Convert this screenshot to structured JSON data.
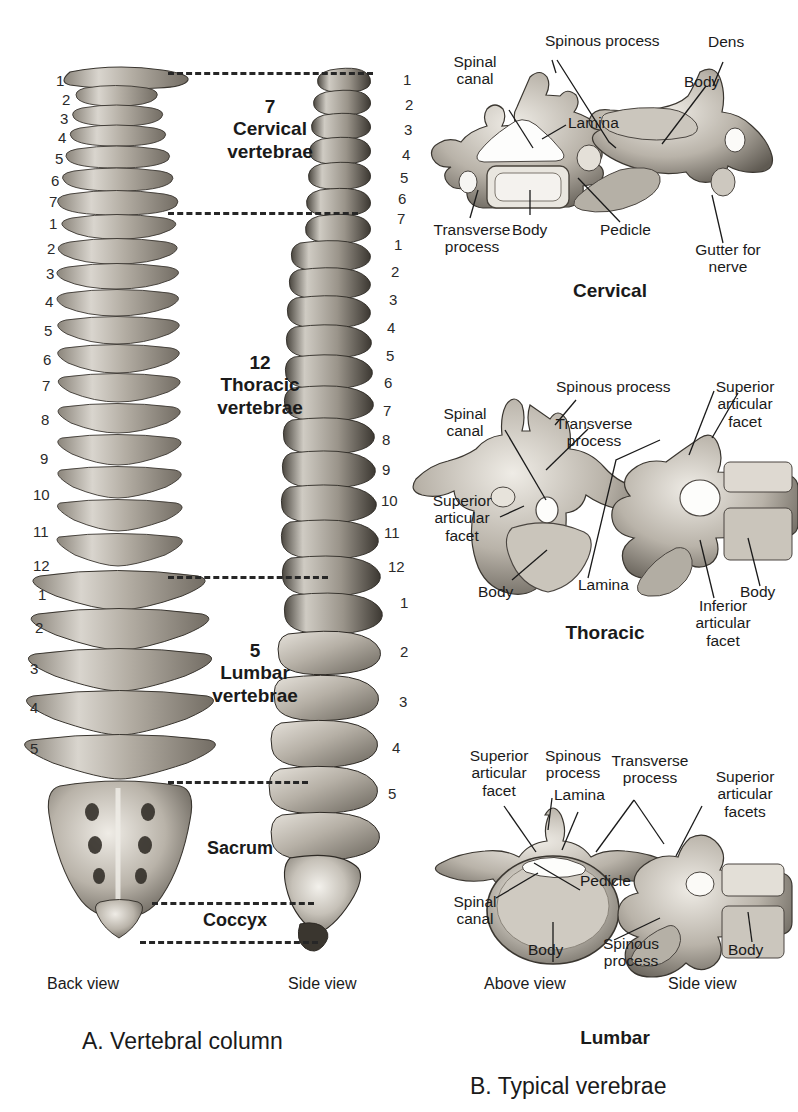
{
  "panelA": {
    "caption": "A. Vertebral column",
    "views": {
      "back": "Back view",
      "side": "Side view"
    },
    "regions": [
      {
        "count": "7",
        "name_line1": "Cervical",
        "name_line2": "vertebrae"
      },
      {
        "count": "12",
        "name_line1": "Thoracic",
        "name_line2": "vertebrae"
      },
      {
        "count": "5",
        "name_line1": "Lumbar",
        "name_line2": "vertebrae"
      }
    ],
    "sacrum_label": "Sacrum",
    "coccyx_label": "Coccyx",
    "back_numbers": {
      "cervical": [
        "1",
        "2",
        "3",
        "4",
        "5",
        "6",
        "7"
      ],
      "thoracic": [
        "1",
        "2",
        "3",
        "4",
        "5",
        "6",
        "7",
        "8",
        "9",
        "10",
        "11",
        "12"
      ],
      "lumbar": [
        "1",
        "2",
        "3",
        "4",
        "5"
      ]
    },
    "side_numbers": {
      "cervical": [
        "1",
        "2",
        "3",
        "4",
        "5",
        "6",
        "7"
      ],
      "thoracic": [
        "1",
        "2",
        "3",
        "4",
        "5",
        "6",
        "7",
        "8",
        "9",
        "10",
        "11",
        "12"
      ],
      "lumbar": [
        "1",
        "2",
        "3",
        "4",
        "5"
      ]
    }
  },
  "panelB": {
    "caption": "B. Typical verebrae",
    "groups": [
      {
        "title": "Cervical",
        "labels": {
          "spinal_canal": "Spinal\ncanal",
          "spinous_process": "Spinous process",
          "lamina": "Lamina",
          "transverse_process": "Transverse\nprocess",
          "body_left": "Body",
          "pedicle": "Pedicle",
          "dens": "Dens",
          "body_right": "Body",
          "gutter": "Gutter for\nnerve"
        }
      },
      {
        "title": "Thoracic",
        "labels": {
          "spinal_canal": "Spinal\ncanal",
          "spinous_process": "Spinous process",
          "transverse_process": "Transverse\nprocess",
          "superior_facet_left": "Superior\narticular\nfacet",
          "body_left": "Body",
          "lamina": "Lamina",
          "superior_facet_right": "Superior\narticular\nfacet",
          "body_right": "Body",
          "inferior_facet": "Inferior\narticular\nfacet"
        }
      },
      {
        "title": "Lumbar",
        "views": {
          "above": "Above view",
          "side": "Side view"
        },
        "labels": {
          "superior_facet": "Superior\narticular\nfacet",
          "spinous_process_top": "Spinous\nprocess",
          "lamina": "Lamina",
          "transverse_process": "Transverse\nprocess",
          "superior_facets": "Superior\narticular\nfacets",
          "spinal_canal": "Spinal\ncanal",
          "body_left": "Body",
          "pedicle": "Pedicle",
          "spinous_process_bottom": "Spinous\nprocess",
          "body_right": "Body"
        }
      }
    ]
  },
  "colors": {
    "ink": "#1a1a1a",
    "bone_light": "#d8d4cd",
    "bone_mid": "#a8a39a",
    "bone_dark": "#5d584f",
    "background": "#ffffff"
  }
}
